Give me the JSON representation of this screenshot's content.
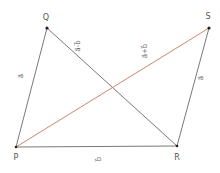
{
  "diagram": {
    "type": "vector-parallelogram",
    "colors": {
      "edge": "#555555",
      "diagonal_sum": "#c8775c",
      "point": "#222222",
      "label": "#555555"
    },
    "points": [
      {
        "id": "P",
        "label": "P",
        "x": 16,
        "y": 147,
        "lx": 16,
        "ly": 160
      },
      {
        "id": "Q",
        "label": "Q",
        "x": 47,
        "y": 28,
        "lx": 46,
        "ly": 19
      },
      {
        "id": "R",
        "label": "R",
        "x": 177,
        "y": 146,
        "lx": 177,
        "ly": 160
      },
      {
        "id": "S",
        "label": "S",
        "x": 209,
        "y": 28,
        "lx": 208,
        "ly": 18
      }
    ],
    "segments": [
      {
        "from": "P",
        "to": "Q",
        "label": "a",
        "arrow": "→",
        "lx": 23,
        "ly": 76
      },
      {
        "from": "Q",
        "to": "R",
        "label": "a-b",
        "arrow": "→",
        "lx": 80,
        "ly": 46
      },
      {
        "from": "P",
        "to": "R",
        "label": "b",
        "arrow": "→",
        "lx": 101,
        "ly": 159
      },
      {
        "from": "R",
        "to": "S",
        "label": "a",
        "arrow": "→",
        "lx": 203,
        "ly": 78
      },
      {
        "from": "P",
        "to": "S",
        "label": "a+b",
        "arrow": "→",
        "lx": 147,
        "ly": 51,
        "color": "diagonal_sum"
      }
    ]
  },
  "labels": {
    "P": "P",
    "Q": "Q",
    "R": "R",
    "S": "S",
    "pq": "a⃗",
    "qr": "a⃗-b⃗",
    "pr": "b⃗",
    "rs": "a⃗",
    "ps": "a⃗+b⃗"
  }
}
